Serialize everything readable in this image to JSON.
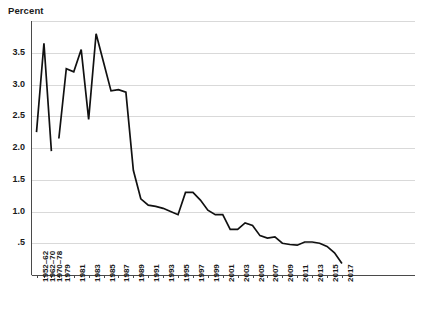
{
  "chart_data": {
    "type": "line",
    "title": "",
    "ylabel": "Percent",
    "xlabel": "",
    "ylim": [
      0,
      4.0
    ],
    "yticks": [
      3.5,
      3.0,
      2.5,
      2.0,
      1.5,
      1.0,
      0.5
    ],
    "ytick_labels": [
      "3.5",
      "3.0",
      "2.5",
      "2.0",
      "1.5",
      "1.0",
      ".5"
    ],
    "grid": true,
    "legend": "none",
    "xtick_labels": [
      "1952–62",
      "1962–70",
      "1970–78",
      "1979",
      "1981",
      "1983",
      "1985",
      "1987",
      "1989",
      "1991",
      "1993",
      "1995",
      "1997",
      "1999",
      "2001",
      "2003",
      "2005",
      "2007",
      "2009",
      "2011",
      "2013",
      "2015",
      "2017"
    ],
    "series": [
      {
        "name": "Percent",
        "points": [
          {
            "x": "1952–62",
            "y": 2.25
          },
          {
            "x": "1962–70",
            "y": 3.65
          },
          {
            "x": "1970–78",
            "y": 1.95
          },
          {
            "x": "1979",
            "y": 2.15
          },
          {
            "x": "1980",
            "y": 3.25
          },
          {
            "x": "1981",
            "y": 3.2
          },
          {
            "x": "1982",
            "y": 3.55
          },
          {
            "x": "1983",
            "y": 2.45
          },
          {
            "x": "1984",
            "y": 3.8
          },
          {
            "x": "1985",
            "y": 3.35
          },
          {
            "x": "1986",
            "y": 2.9
          },
          {
            "x": "1987",
            "y": 2.92
          },
          {
            "x": "1988",
            "y": 2.88
          },
          {
            "x": "1989",
            "y": 1.65
          },
          {
            "x": "1990",
            "y": 1.2
          },
          {
            "x": "1991",
            "y": 1.1
          },
          {
            "x": "1992",
            "y": 1.08
          },
          {
            "x": "1993",
            "y": 1.05
          },
          {
            "x": "1994",
            "y": 1.0
          },
          {
            "x": "1995",
            "y": 0.95
          },
          {
            "x": "1996",
            "y": 1.3
          },
          {
            "x": "1997",
            "y": 1.3
          },
          {
            "x": "1998",
            "y": 1.18
          },
          {
            "x": "1999",
            "y": 1.02
          },
          {
            "x": "2000",
            "y": 0.95
          },
          {
            "x": "2001",
            "y": 0.95
          },
          {
            "x": "2002",
            "y": 0.72
          },
          {
            "x": "2003",
            "y": 0.72
          },
          {
            "x": "2004",
            "y": 0.82
          },
          {
            "x": "2005",
            "y": 0.78
          },
          {
            "x": "2006",
            "y": 0.62
          },
          {
            "x": "2007",
            "y": 0.58
          },
          {
            "x": "2008",
            "y": 0.6
          },
          {
            "x": "2009",
            "y": 0.5
          },
          {
            "x": "2010",
            "y": 0.48
          },
          {
            "x": "2011",
            "y": 0.47
          },
          {
            "x": "2012",
            "y": 0.52
          },
          {
            "x": "2013",
            "y": 0.52
          },
          {
            "x": "2014",
            "y": 0.5
          },
          {
            "x": "2015",
            "y": 0.45
          },
          {
            "x": "2016",
            "y": 0.35
          },
          {
            "x": "2017",
            "y": 0.18
          }
        ]
      }
    ],
    "break_after_index": 2,
    "colors": {
      "line": "#111111",
      "grid": "#d9d9d9",
      "axis": "#4a4a4a",
      "text": "#1a1a1a",
      "background": "#ffffff"
    }
  }
}
